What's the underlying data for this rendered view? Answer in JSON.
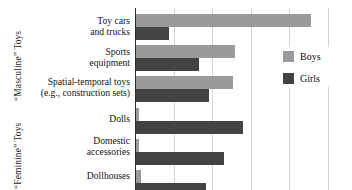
{
  "chart_data": {
    "type": "bar",
    "orientation": "horizontal",
    "title": "",
    "xlabel": "",
    "ylabel": "",
    "categories": [
      "Toy cars and trucks",
      "Sports equipment",
      "Spatial-temporal toys (e.g., construction sets)",
      "Dolls",
      "Domestic accessories",
      "Dollhouses"
    ],
    "series": [
      {
        "name": "Boys",
        "color": "#9a9a9a",
        "values": [
          4.55,
          2.57,
          2.52,
          0.08,
          0.08,
          0.13
        ]
      },
      {
        "name": "Girls",
        "color": "#434343",
        "values": [
          0.86,
          1.64,
          1.9,
          2.78,
          2.29,
          1.82
        ]
      }
    ],
    "xlim": [
      0,
      5.6
    ],
    "gridlines_at": [
      1,
      2,
      3,
      4,
      5
    ],
    "grid": true,
    "legend_position": "right"
  },
  "axis": {
    "group_labels": [
      {
        "id": "masculine",
        "text": "“Masculine” Toys"
      },
      {
        "id": "feminine",
        "text": "“Feminine” Toys"
      }
    ],
    "category_labels": [
      {
        "lines": [
          "Toy cars",
          "and trucks"
        ]
      },
      {
        "lines": [
          "Sports",
          "equipment"
        ]
      },
      {
        "lines": [
          "Spatial-temporal toys",
          "(e.g., construction sets)"
        ]
      },
      {
        "lines": [
          "Dolls"
        ]
      },
      {
        "lines": [
          "Domestic",
          "accessories"
        ]
      },
      {
        "lines": [
          "Dollhouses"
        ]
      }
    ]
  },
  "legend": {
    "items": [
      {
        "label": "Boys",
        "color": "#9a9a9a"
      },
      {
        "label": "Girls",
        "color": "#434343"
      }
    ]
  }
}
